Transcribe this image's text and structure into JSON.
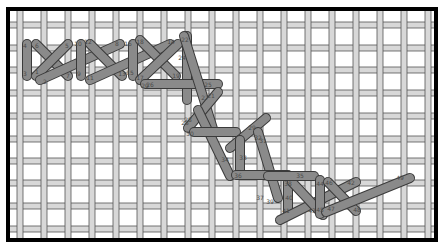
{
  "diagram": {
    "colors": {
      "background": "#ffffff",
      "thread": "#d8d8d8",
      "thread_edge": "#555555",
      "stitch_fill": "#8a8a8a",
      "stitch_outline": "#3a3a3a",
      "frame": "#000000"
    },
    "frame": {
      "x": 8,
      "y": 9,
      "width": 428,
      "height": 231
    },
    "grid": {
      "vertical_threads_x": [
        20,
        44,
        68,
        92,
        116,
        140,
        164,
        188,
        212,
        236,
        260,
        284,
        308,
        332,
        356,
        380,
        404,
        428
      ],
      "horizontal_threads_y": [
        25,
        48,
        70,
        93,
        116,
        139,
        161,
        183,
        206,
        229
      ]
    },
    "stitches": [
      {
        "x1": 27,
        "y1": 44,
        "x2": 27,
        "y2": 76
      },
      {
        "x1": 36,
        "y1": 44,
        "x2": 68,
        "y2": 76
      },
      {
        "x1": 36,
        "y1": 76,
        "x2": 68,
        "y2": 44
      },
      {
        "x1": 40,
        "y1": 80,
        "x2": 120,
        "y2": 44
      },
      {
        "x1": 81,
        "y1": 44,
        "x2": 81,
        "y2": 76
      },
      {
        "x1": 90,
        "y1": 44,
        "x2": 122,
        "y2": 76
      },
      {
        "x1": 90,
        "y1": 80,
        "x2": 170,
        "y2": 44
      },
      {
        "x1": 133,
        "y1": 44,
        "x2": 133,
        "y2": 76
      },
      {
        "x1": 140,
        "y1": 40,
        "x2": 176,
        "y2": 76
      },
      {
        "x1": 140,
        "y1": 80,
        "x2": 178,
        "y2": 44
      },
      {
        "x1": 187,
        "y1": 36,
        "x2": 187,
        "y2": 100
      },
      {
        "x1": 145,
        "y1": 84,
        "x2": 218,
        "y2": 84
      },
      {
        "x1": 184,
        "y1": 36,
        "x2": 214,
        "y2": 132
      },
      {
        "x1": 188,
        "y1": 128,
        "x2": 218,
        "y2": 92
      },
      {
        "x1": 198,
        "y1": 110,
        "x2": 230,
        "y2": 176
      },
      {
        "x1": 194,
        "y1": 132,
        "x2": 236,
        "y2": 132
      },
      {
        "x1": 230,
        "y1": 148,
        "x2": 266,
        "y2": 118
      },
      {
        "x1": 240,
        "y1": 140,
        "x2": 240,
        "y2": 174
      },
      {
        "x1": 258,
        "y1": 132,
        "x2": 278,
        "y2": 198
      },
      {
        "x1": 236,
        "y1": 175,
        "x2": 288,
        "y2": 175
      },
      {
        "x1": 288,
        "y1": 182,
        "x2": 288,
        "y2": 212
      },
      {
        "x1": 280,
        "y1": 220,
        "x2": 356,
        "y2": 182
      },
      {
        "x1": 292,
        "y1": 182,
        "x2": 323,
        "y2": 215
      },
      {
        "x1": 268,
        "y1": 176,
        "x2": 314,
        "y2": 176
      },
      {
        "x1": 320,
        "y1": 180,
        "x2": 320,
        "y2": 214
      },
      {
        "x1": 328,
        "y1": 182,
        "x2": 356,
        "y2": 211
      },
      {
        "x1": 326,
        "y1": 212,
        "x2": 410,
        "y2": 178
      }
    ],
    "labels": [
      {
        "text": "4",
        "x": 25,
        "y": 48
      },
      {
        "text": "6",
        "x": 37,
        "y": 48
      },
      {
        "text": "3",
        "x": 25,
        "y": 76
      },
      {
        "text": "1",
        "x": 37,
        "y": 74
      },
      {
        "text": "2",
        "x": 45,
        "y": 84
      },
      {
        "text": "5",
        "x": 67,
        "y": 48
      },
      {
        "text": "7",
        "x": 68,
        "y": 78
      },
      {
        "text": "10",
        "x": 78,
        "y": 46
      },
      {
        "text": "12",
        "x": 88,
        "y": 44
      },
      {
        "text": "8",
        "x": 117,
        "y": 46
      },
      {
        "text": "9",
        "x": 79,
        "y": 76
      },
      {
        "text": "11",
        "x": 90,
        "y": 80
      },
      {
        "text": "13",
        "x": 122,
        "y": 76
      },
      {
        "text": "16",
        "x": 128,
        "y": 46
      },
      {
        "text": "18",
        "x": 140,
        "y": 44
      },
      {
        "text": "14",
        "x": 171,
        "y": 44
      },
      {
        "text": "15",
        "x": 130,
        "y": 75
      },
      {
        "text": "17",
        "x": 140,
        "y": 80
      },
      {
        "text": "19",
        "x": 176,
        "y": 78
      },
      {
        "text": "22",
        "x": 185,
        "y": 42
      },
      {
        "text": "24",
        "x": 182,
        "y": 60
      },
      {
        "text": "20",
        "x": 145,
        "y": 88
      },
      {
        "text": "26",
        "x": 150,
        "y": 87
      },
      {
        "text": "25",
        "x": 208,
        "y": 87
      },
      {
        "text": "27",
        "x": 205,
        "y": 100
      },
      {
        "text": "21",
        "x": 211,
        "y": 98
      },
      {
        "text": "23",
        "x": 185,
        "y": 125
      },
      {
        "text": "28",
        "x": 188,
        "y": 122
      },
      {
        "text": "30",
        "x": 190,
        "y": 136
      },
      {
        "text": "29",
        "x": 252,
        "y": 130
      },
      {
        "text": "32",
        "x": 258,
        "y": 140
      },
      {
        "text": "31",
        "x": 263,
        "y": 143
      },
      {
        "text": "33",
        "x": 243,
        "y": 160
      },
      {
        "text": "34",
        "x": 225,
        "y": 162
      },
      {
        "text": "36",
        "x": 238,
        "y": 178
      },
      {
        "text": "35",
        "x": 300,
        "y": 178
      },
      {
        "text": "37",
        "x": 260,
        "y": 200
      },
      {
        "text": "39",
        "x": 270,
        "y": 204
      },
      {
        "text": "38",
        "x": 288,
        "y": 186
      },
      {
        "text": "40",
        "x": 289,
        "y": 200
      },
      {
        "text": "44",
        "x": 320,
        "y": 186
      },
      {
        "text": "46",
        "x": 329,
        "y": 185
      },
      {
        "text": "42",
        "x": 351,
        "y": 185
      },
      {
        "text": "41",
        "x": 286,
        "y": 213
      },
      {
        "text": "43",
        "x": 312,
        "y": 213
      },
      {
        "text": "45",
        "x": 320,
        "y": 212
      },
      {
        "text": "47",
        "x": 331,
        "y": 211
      },
      {
        "text": "48",
        "x": 357,
        "y": 212
      },
      {
        "text": "49",
        "x": 400,
        "y": 180
      }
    ]
  }
}
